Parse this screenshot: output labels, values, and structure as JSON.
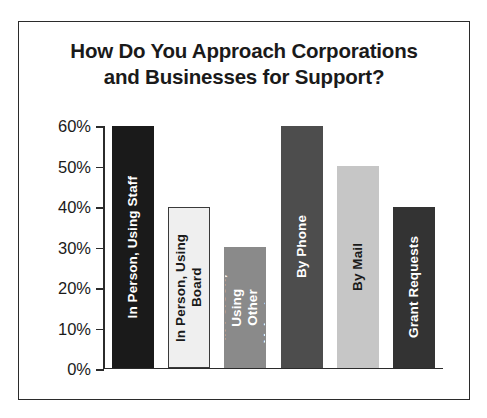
{
  "title": "How Do You Approach Corporations\nand Businesses for Support?",
  "frame": {
    "border_color": "#2b2b2b",
    "background": "#ffffff"
  },
  "chart_data": {
    "type": "bar",
    "title": "How Do You Approach Corporations and Businesses for Support?",
    "xlabel": "",
    "ylabel": "",
    "ylim": [
      0,
      60
    ],
    "grid": false,
    "legend": "none",
    "y_ticks": [
      "0%",
      "10%",
      "20%",
      "30%",
      "40%",
      "50%",
      "60%"
    ],
    "y_tick_values": [
      0,
      10,
      20,
      30,
      40,
      50,
      60
    ],
    "categories": [
      "In Person, Using Staff",
      "In Person, Using Board",
      "In Person, Using Other Volunteers",
      "By Phone",
      "By Mail",
      "Grant Requests"
    ],
    "values": [
      60,
      40,
      30,
      60,
      50,
      40
    ],
    "bars": [
      {
        "label": "In Person, Using Staff",
        "label_lines": "In Person, Using Staff",
        "value": 60,
        "value_text": "60%",
        "fill": "#1a1a1a",
        "stroke": "#1a1a1a",
        "text_color": "#ffffff"
      },
      {
        "label": "In Person, Using Board",
        "label_lines": "In Person, Using Board",
        "value": 40,
        "value_text": "40%",
        "fill": "#efefef",
        "stroke": "#3a3a3a",
        "text_color": "#1a1a1a"
      },
      {
        "label": "In Person, Using Other Volunteers",
        "label_lines": "In Person, Using\nOther Volunteers",
        "value": 30,
        "value_text": "30%",
        "fill": "#8a8a8a",
        "stroke": "#8a8a8a",
        "text_color": "#ffffff"
      },
      {
        "label": "By Phone",
        "label_lines": "By Phone",
        "value": 60,
        "value_text": "60%",
        "fill": "#4d4d4d",
        "stroke": "#4d4d4d",
        "text_color": "#ffffff"
      },
      {
        "label": "By Mail",
        "label_lines": "By Mail",
        "value": 50,
        "value_text": "50%",
        "fill": "#c6c6c6",
        "stroke": "#c6c6c6",
        "text_color": "#1a1a1a"
      },
      {
        "label": "Grant Requests",
        "label_lines": "Grant Requests",
        "value": 40,
        "value_text": "40%",
        "fill": "#333333",
        "stroke": "#333333",
        "text_color": "#ffffff"
      }
    ]
  }
}
